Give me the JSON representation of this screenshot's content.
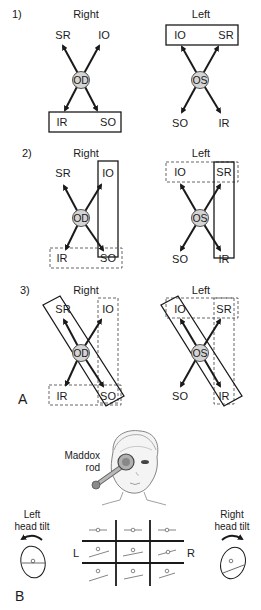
{
  "panel_a": {
    "label": "A",
    "rows": [
      {
        "num": "1)",
        "right": {
          "title": "Right",
          "center": "OD",
          "tl": "SR",
          "tr": "IO",
          "bl": "IR",
          "br": "SO"
        },
        "left": {
          "title": "Left",
          "center": "OS",
          "tl": "IO",
          "tr": "SR",
          "bl": "SO",
          "br": "IR"
        }
      },
      {
        "num": "2)",
        "right": {
          "title": "Right",
          "center": "OD",
          "tl": "SR",
          "tr": "IO",
          "bl": "IR",
          "br": "SO"
        },
        "left": {
          "title": "Left",
          "center": "OS",
          "tl": "IO",
          "tr": "SR",
          "bl": "SO",
          "br": "IR"
        }
      },
      {
        "num": "3)",
        "right": {
          "title": "Right",
          "center": "OD",
          "tl": "SR",
          "tr": "IO",
          "bl": "IR",
          "br": "SO"
        },
        "left": {
          "title": "Left",
          "center": "OS",
          "tl": "IO",
          "tr": "SR",
          "bl": "SO",
          "br": "IR"
        }
      }
    ]
  },
  "panel_b": {
    "label": "B",
    "maddox_line1": "Maddox",
    "maddox_line2": "rod",
    "left_tilt_line1": "Left",
    "left_tilt_line2": "head tilt",
    "right_tilt_line1": "Right",
    "right_tilt_line2": "head tilt",
    "grid_left": "L",
    "grid_right": "R"
  },
  "colors": {
    "stroke": "#1a1a1a",
    "circle_fill": "#d4d4d4",
    "rod_fill": "#9a9a9a"
  }
}
